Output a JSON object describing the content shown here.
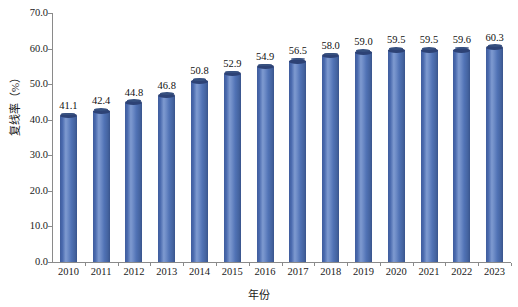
{
  "chart_data": {
    "type": "bar",
    "title": "",
    "subtitle": "",
    "xlabel": "年份",
    "ylabel": "复线率（%）",
    "categories": [
      "2010",
      "2011",
      "2012",
      "2013",
      "2014",
      "2015",
      "2016",
      "2017",
      "2018",
      "2019",
      "2020",
      "2021",
      "2022",
      "2023"
    ],
    "values": [
      41.1,
      42.4,
      44.8,
      46.8,
      50.8,
      52.9,
      54.9,
      56.5,
      58.0,
      59.0,
      59.5,
      59.5,
      59.6,
      60.3
    ],
    "value_labels": [
      "41.1",
      "42.4",
      "44.8",
      "46.8",
      "50.8",
      "52.9",
      "54.9",
      "56.5",
      "58.0",
      "59.0",
      "59.5",
      "59.5",
      "59.6",
      "60.3"
    ],
    "ylim": [
      0.0,
      70.0
    ],
    "ytick_values": [
      0.0,
      10.0,
      20.0,
      30.0,
      40.0,
      50.0,
      60.0,
      70.0
    ],
    "ytick_labels": [
      "0.0",
      "10.0",
      "20.0",
      "30.0",
      "40.0",
      "50.0",
      "60.0",
      "70.0"
    ],
    "grid": false,
    "legend": false,
    "legend_position": "none",
    "series": [
      {
        "name": "复线率",
        "values": [
          41.1,
          42.4,
          44.8,
          46.8,
          50.8,
          52.9,
          54.9,
          56.5,
          58.0,
          59.0,
          59.5,
          59.5,
          59.6,
          60.3
        ]
      }
    ],
    "colors": {
      "bar_fill": "#5173b6",
      "bar_highlight": "#7e9ad0",
      "bar_shadow": "#39548c",
      "bar_cap": "#2d4275",
      "axis": "#8a8a8a",
      "text": "#1a1a1a",
      "background": "#ffffff"
    }
  }
}
